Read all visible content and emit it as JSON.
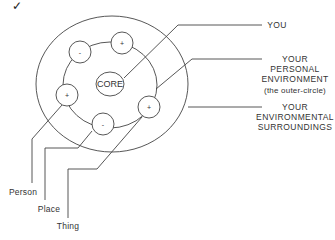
{
  "check_mark": "✓",
  "diagram": {
    "core_label": "CORE",
    "charges": [
      "-",
      "+",
      "+",
      "-",
      "+"
    ],
    "right_labels": {
      "you": "YOU",
      "personal": [
        "YOUR",
        "PERSONAL",
        "ENVIRONMENT"
      ],
      "personal_note": "(the outer-circle)",
      "surroundings": [
        "YOUR",
        "ENVIRONMENTAL",
        "SURROUNDINGS"
      ]
    },
    "bottom_labels": {
      "person": "Person",
      "place": "Place",
      "thing": "Thing"
    },
    "colors": {
      "stroke": "#444444",
      "text": "#333333"
    }
  }
}
